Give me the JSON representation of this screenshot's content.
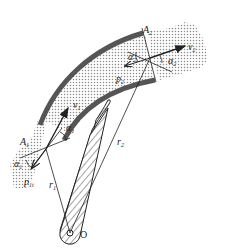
{
  "diagram": {
    "title": "",
    "labels": {
      "A1": {
        "base": "A",
        "sub": "1"
      },
      "A2": {
        "base": "A",
        "sub": "2"
      },
      "v1": {
        "base": "v",
        "sub": "1"
      },
      "v2": {
        "base": "v",
        "sub": "2"
      },
      "p1": {
        "base": "p",
        "sub": "1t"
      },
      "p2": {
        "base": "p",
        "sub": "2"
      },
      "r1": {
        "base": "r",
        "sub": "1"
      },
      "r2": {
        "base": "r",
        "sub": "2"
      },
      "alpha1_left": {
        "base": "α",
        "sub": "1"
      },
      "alpha1_right": {
        "base": "α",
        "sub": "1"
      },
      "alpha2_left": {
        "base": "α",
        "sub": "2"
      },
      "alpha2_right": {
        "base": "α",
        "sub": "2"
      },
      "O": "O"
    },
    "colors": {
      "ink": "#222222",
      "wall": "#555555",
      "dots": "#9a9a9a"
    }
  }
}
